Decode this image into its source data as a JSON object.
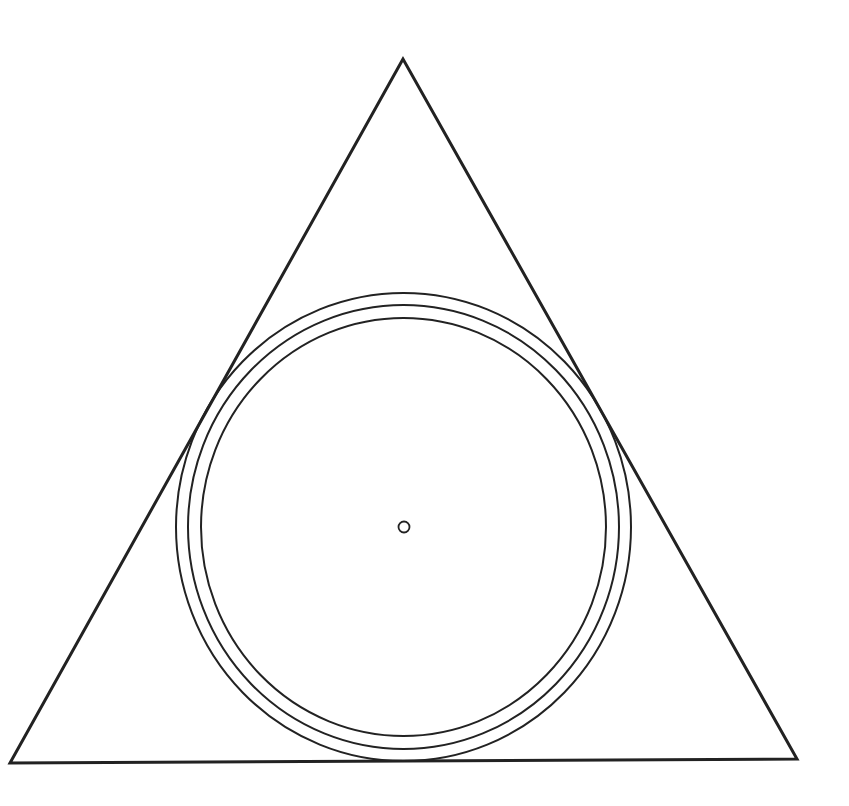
{
  "diagram": {
    "background": "#ffffff",
    "stroke_color": "#222222",
    "triangle": {
      "points": [
        [
          403,
          59
        ],
        [
          10,
          763
        ],
        [
          797,
          759
        ]
      ],
      "stroke_width": 3
    },
    "circles": [
      {
        "name": "outer-circle",
        "cx": 403.5,
        "cy": 527,
        "rx": 227.5,
        "ry": 234,
        "stroke_width": 2
      },
      {
        "name": "middle-circle",
        "cx": 403.5,
        "cy": 527,
        "rx": 215.5,
        "ry": 222,
        "stroke_width": 2
      },
      {
        "name": "inner-circle",
        "cx": 403.5,
        "cy": 527,
        "rx": 202.5,
        "ry": 209,
        "stroke_width": 2
      }
    ],
    "center_point": {
      "cx": 404,
      "cy": 527,
      "r": 5.5,
      "stroke_width": 1.8
    }
  }
}
